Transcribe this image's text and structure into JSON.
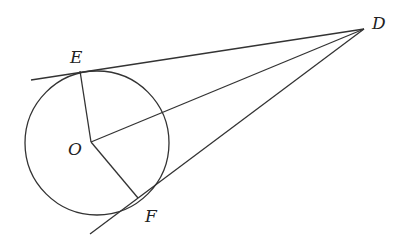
{
  "figure": {
    "labels": {
      "D": "D",
      "E": "E",
      "O": "O",
      "F": "F"
    },
    "points": {
      "D": [
        364,
        29
      ],
      "E": [
        80,
        71
      ],
      "O": [
        91,
        142
      ],
      "F": [
        138,
        198
      ]
    },
    "circle": {
      "center": [
        97,
        143
      ],
      "radius": 72
    },
    "stroke_color": "#333333"
  }
}
